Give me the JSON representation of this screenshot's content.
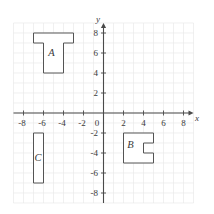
{
  "figure": {
    "background": "#ffffff",
    "grid_color": "#e9e9e9",
    "axis_color": "#4a4a4a",
    "shape_stroke": "#545454",
    "shape_fill": "#ffffff",
    "text_color": "#3a3a3a"
  },
  "chart_data": {
    "type": "line",
    "title": "",
    "xlabel": "x",
    "ylabel": "y",
    "xlim": [
      -9,
      9
    ],
    "ylim": [
      -9,
      9
    ],
    "grid": true,
    "grid_step": 1,
    "tick_step": 2,
    "x_ticks": [
      -8,
      -6,
      -4,
      -2,
      0,
      2,
      4,
      6,
      8
    ],
    "y_ticks": [
      8,
      6,
      4,
      2,
      -2,
      -4,
      -6,
      -8
    ],
    "shapes": [
      {
        "label": "A",
        "vertices": [
          [
            -7,
            8
          ],
          [
            -3,
            8
          ],
          [
            -3,
            7
          ],
          [
            -4,
            7
          ],
          [
            -4,
            4
          ],
          [
            -6,
            4
          ],
          [
            -6,
            7
          ],
          [
            -7,
            7
          ]
        ],
        "label_pos": [
          -5.2,
          5.7
        ]
      },
      {
        "label": "B",
        "vertices": [
          [
            2,
            -2
          ],
          [
            5,
            -2
          ],
          [
            5,
            -3
          ],
          [
            4,
            -3
          ],
          [
            4,
            -4
          ],
          [
            5,
            -4
          ],
          [
            5,
            -5
          ],
          [
            2,
            -5
          ]
        ],
        "label_pos": [
          2.7,
          -3.5
        ]
      },
      {
        "label": "C",
        "vertices": [
          [
            -7,
            -2
          ],
          [
            -6,
            -2
          ],
          [
            -6,
            -7
          ],
          [
            -7,
            -7
          ]
        ],
        "label_pos": [
          -6.55,
          -4.8
        ]
      }
    ]
  }
}
